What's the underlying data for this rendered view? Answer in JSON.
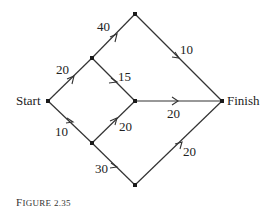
{
  "diagram": {
    "type": "directed-network",
    "caption": "Figure 2.35",
    "nodes": [
      {
        "id": "start",
        "label": "Start",
        "x": 48,
        "y": 101
      },
      {
        "id": "a",
        "label": "",
        "x": 92,
        "y": 58
      },
      {
        "id": "top",
        "label": "",
        "x": 135,
        "y": 14
      },
      {
        "id": "c",
        "label": "",
        "x": 135,
        "y": 101
      },
      {
        "id": "b",
        "label": "",
        "x": 92,
        "y": 143
      },
      {
        "id": "bottom",
        "label": "",
        "x": 135,
        "y": 185
      },
      {
        "id": "finish",
        "label": "Finish",
        "x": 222,
        "y": 101
      }
    ],
    "edges": [
      {
        "from": "start",
        "to": "a",
        "weight": "20"
      },
      {
        "from": "a",
        "to": "top",
        "weight": "40"
      },
      {
        "from": "a",
        "to": "c",
        "weight": "15"
      },
      {
        "from": "top",
        "to": "finish",
        "weight": "10"
      },
      {
        "from": "start",
        "to": "b",
        "weight": "10"
      },
      {
        "from": "b",
        "to": "c",
        "weight": "20"
      },
      {
        "from": "c",
        "to": "finish",
        "weight": "20"
      },
      {
        "from": "b",
        "to": "bottom",
        "weight": "30"
      },
      {
        "from": "bottom",
        "to": "finish",
        "weight": "20"
      }
    ]
  },
  "labels": {
    "start": "Start",
    "finish": "Finish",
    "caption_first": "F",
    "caption_rest": "IGURE 2.35"
  },
  "weights": {
    "start_a": "20",
    "a_top": "40",
    "a_c": "15",
    "top_finish": "10",
    "start_b": "10",
    "b_c": "20",
    "c_finish": "20",
    "b_bottom": "30",
    "bottom_finish": "20"
  }
}
